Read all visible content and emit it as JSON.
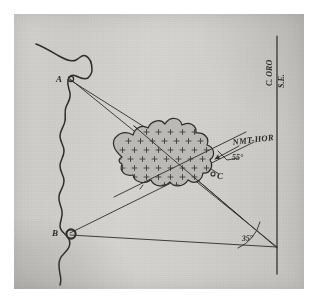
{
  "document": {
    "kind": "hand-drawn-survey-diagram",
    "caption": "",
    "paper_color": "#d2d1ce",
    "ink_color": "#2e2d2b",
    "shoal_fill_color": "#bdbcb8"
  },
  "labels": {
    "point_a": "A",
    "point_b": "B",
    "point_c": "C",
    "shoal_note": "NMT-HOR",
    "angle_upper": "55°",
    "angle_lower": "35°",
    "meridian_top": "C. ORO",
    "meridian_sub": "S.E."
  },
  "features": {
    "coastline_name": "coastline",
    "shoal_name": "hatched-shoal-area",
    "meridian_name": "vertical-reference-line",
    "baseline_name": "horizontal-baseline",
    "sight_line_names": [
      "sight-line-a-to-vertex",
      "sight-line-a-to-c",
      "sight-line-b-to-vertex",
      "sight-line-b-to-shoal"
    ]
  },
  "geometry": {
    "point_a": {
      "x": 54,
      "y": 64
    },
    "point_b": {
      "x": 52,
      "y": 219
    },
    "point_c": {
      "x": 196,
      "y": 157
    },
    "vertex": {
      "x": 263,
      "y": 233
    },
    "meridian_x": 263,
    "meridian_top_y": 22,
    "meridian_bottom_y": 260,
    "angle_upper_deg": 55,
    "angle_lower_deg": 35
  }
}
